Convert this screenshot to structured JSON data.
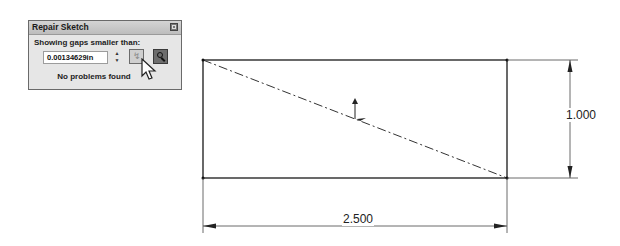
{
  "dialog": {
    "title": "Repair Sketch",
    "label": "Showing gaps smaller than:",
    "gap_value": "0.00134629in",
    "refresh_icon": "gap-refresh-icon",
    "search_icon": "magnifier-icon",
    "status": "No problems found"
  },
  "sketch": {
    "dimension_width": "2.500",
    "dimension_height": "1.000"
  }
}
